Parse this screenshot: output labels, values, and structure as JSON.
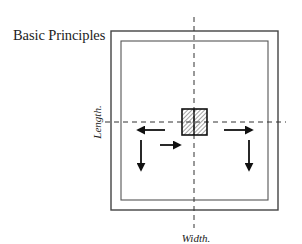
{
  "title": "Basic Principles",
  "labels": {
    "vertical_axis": "Length.",
    "horizontal_axis": "Width."
  },
  "diagram": {
    "outer_frame": {
      "x": 111,
      "y": 31,
      "width": 167,
      "height": 179
    },
    "inner_frame": {
      "x": 121,
      "y": 41,
      "width": 147,
      "height": 159
    },
    "center_block": {
      "x": 182,
      "y": 109,
      "width": 25,
      "height": 26,
      "fill": "hatched"
    },
    "centerlines": {
      "vertical": {
        "x": 194,
        "y1": 17,
        "y2": 228,
        "style": "dashed"
      },
      "horizontal": {
        "y": 122,
        "x1": 105,
        "x2": 286,
        "style": "dashed"
      }
    },
    "arrows": [
      {
        "name": "arrow-left-outward",
        "direction": "left",
        "x1": 165,
        "y1": 130,
        "x2": 137,
        "y2": 130
      },
      {
        "name": "arrow-left-down",
        "direction": "down",
        "x1": 141,
        "y1": 140,
        "x2": 141,
        "y2": 170
      },
      {
        "name": "arrow-left-inward",
        "direction": "right",
        "x1": 160,
        "y1": 145,
        "x2": 181,
        "y2": 145
      },
      {
        "name": "arrow-right-outward",
        "direction": "right",
        "x1": 224,
        "y1": 130,
        "x2": 253,
        "y2": 130
      },
      {
        "name": "arrow-right-down",
        "direction": "down",
        "x1": 249,
        "y1": 140,
        "x2": 249,
        "y2": 170
      }
    ],
    "colors": {
      "line": "#222222",
      "frame": "#444444",
      "hatch": "#555555",
      "background": "#ffffff"
    }
  }
}
